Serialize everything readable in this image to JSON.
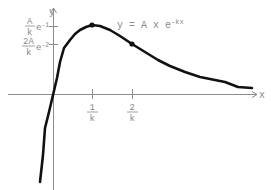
{
  "diagram": {
    "equation": {
      "prefix": "y = A x e",
      "exponent": "-kx"
    },
    "axes": {
      "x_label": "x",
      "y_label": "y"
    },
    "y_ticks": [
      {
        "numerator": "A",
        "denominator": "k",
        "factor": "e",
        "exponent": "-1"
      },
      {
        "numerator": "2A",
        "denominator": "k",
        "factor": "e",
        "exponent": "-2"
      }
    ],
    "x_ticks": [
      {
        "numerator": "1",
        "denominator": "k"
      },
      {
        "numerator": "2",
        "denominator": "k"
      }
    ],
    "marked_points": [
      {
        "name": "maximum",
        "x": "1/k",
        "y": "A/k e^-1"
      },
      {
        "name": "inflection",
        "x": "2/k",
        "y": "2A/k e^-2"
      }
    ],
    "colors": {
      "curve": "#111111",
      "axes": "#8c8c8c",
      "labels": "#8a8a8a"
    }
  }
}
